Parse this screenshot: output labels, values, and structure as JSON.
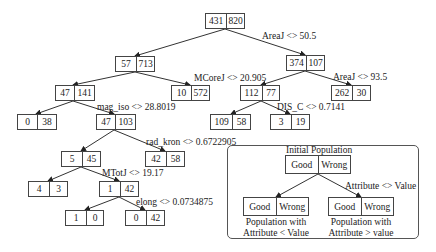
{
  "tree": {
    "nodes": [
      {
        "id": "root",
        "good": "431",
        "wrong": "820"
      },
      {
        "id": "n1",
        "good": "57",
        "wrong": "713"
      },
      {
        "id": "n2",
        "good": "374",
        "wrong": "107"
      },
      {
        "id": "n3",
        "good": "47",
        "wrong": "141"
      },
      {
        "id": "n4",
        "good": "10",
        "wrong": "572"
      },
      {
        "id": "n5",
        "good": "112",
        "wrong": "77"
      },
      {
        "id": "n6",
        "good": "262",
        "wrong": "30"
      },
      {
        "id": "n7",
        "good": "0",
        "wrong": "38"
      },
      {
        "id": "n8",
        "good": "47",
        "wrong": "103"
      },
      {
        "id": "n9",
        "good": "109",
        "wrong": "58"
      },
      {
        "id": "n10",
        "good": "3",
        "wrong": "19"
      },
      {
        "id": "n11",
        "good": "5",
        "wrong": "45"
      },
      {
        "id": "n12",
        "good": "42",
        "wrong": "58"
      },
      {
        "id": "n13",
        "good": "4",
        "wrong": "3"
      },
      {
        "id": "n14",
        "good": "1",
        "wrong": "42"
      },
      {
        "id": "n15",
        "good": "1",
        "wrong": "0"
      },
      {
        "id": "n16",
        "good": "0",
        "wrong": "42"
      }
    ],
    "splits": [
      {
        "node": "root",
        "label": "AreaJ <> 50.5"
      },
      {
        "node": "n1",
        "label": "MCoreJ <> 20.905"
      },
      {
        "node": "n2",
        "label": "AreaJ <> 93.5"
      },
      {
        "node": "n3",
        "label": "mag_iso <> 28.8019"
      },
      {
        "node": "n5",
        "label": "DIS_C <> 0.7141"
      },
      {
        "node": "n8",
        "label": "rad_kron <> 0.6722905"
      },
      {
        "node": "n11",
        "label": "MTotJ <> 19.17"
      },
      {
        "node": "n14",
        "label": "elong <> 0.0734875"
      }
    ],
    "edges": [
      [
        "root",
        "n1"
      ],
      [
        "root",
        "n2"
      ],
      [
        "n1",
        "n3"
      ],
      [
        "n1",
        "n4"
      ],
      [
        "n2",
        "n5"
      ],
      [
        "n2",
        "n6"
      ],
      [
        "n3",
        "n7"
      ],
      [
        "n3",
        "n8"
      ],
      [
        "n5",
        "n9"
      ],
      [
        "n5",
        "n10"
      ],
      [
        "n8",
        "n11"
      ],
      [
        "n8",
        "n12"
      ],
      [
        "n11",
        "n13"
      ],
      [
        "n11",
        "n14"
      ],
      [
        "n14",
        "n15"
      ],
      [
        "n14",
        "n16"
      ]
    ]
  },
  "legend": {
    "title": "Initial Population",
    "good": "Good",
    "wrong": "Wrong",
    "split_label": "Attribute <> Value",
    "left_caption_1": "Population with",
    "left_caption_2": "Attribute < Value",
    "right_caption_1": "Population with",
    "right_caption_2": "Attribute > value"
  }
}
